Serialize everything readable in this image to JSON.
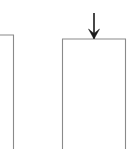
{
  "figure": {
    "background_color": "#ffffff",
    "width": 135,
    "height": 149,
    "outline_color": "#8a8a8a",
    "arrow_color": "#1a1a1a",
    "outline_width": 1.1,
    "arrow_width": 1.6
  },
  "shapes": {
    "left_column": {
      "name": "left-column",
      "label": "",
      "top_y": 35,
      "right_x": 13.5,
      "left_x": -1,
      "bottom_y": 147,
      "clipped_edges": "left, bottom"
    },
    "right_column": {
      "name": "right-column",
      "label": "",
      "top_y": 39,
      "left_x": 62.5,
      "right_x": 125.5,
      "bottom_y": 147,
      "clipped_edges": "bottom"
    }
  },
  "arrow": {
    "name": "load-arrow",
    "label": "",
    "direction": "down",
    "shaft_x": 94,
    "shaft_top_y": 13,
    "shaft_bottom_y": 38.5,
    "head_left_x": 88.5,
    "head_right_x": 99.5,
    "head_top_y": 29,
    "tip_y": 39
  }
}
